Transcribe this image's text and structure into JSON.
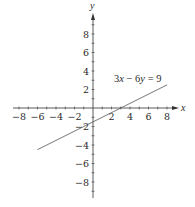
{
  "chart_data": {
    "type": "line",
    "title": "",
    "xlabel": "x",
    "ylabel": "y",
    "xlim": [
      -9,
      9
    ],
    "ylim": [
      -9.5,
      9.5
    ],
    "grid": false,
    "x_ticks": [
      -8,
      -6,
      -4,
      -2,
      2,
      4,
      6,
      8
    ],
    "y_ticks": [
      -8,
      -6,
      -4,
      -2,
      2,
      4,
      6,
      8
    ],
    "x_tick_labels": [
      "−8",
      "−6",
      "−4",
      "−2",
      "2",
      "4",
      "6",
      "8"
    ],
    "y_tick_labels": [
      "−8",
      "−6",
      "−4",
      "−2",
      "2",
      "4",
      "6",
      "8"
    ],
    "series": [
      {
        "name": "3x − 6y = 9",
        "equation": "3x − 6y = 9",
        "x": [
          -6,
          8
        ],
        "y": [
          -4.5,
          2.5
        ],
        "color": "#555555"
      }
    ],
    "annotations": [
      {
        "text": "3x − 6y = 9",
        "x": 2.2,
        "y": 3
      }
    ]
  },
  "labels": {
    "x_axis": "x",
    "y_axis": "y",
    "equation": "3x − 6y = 9"
  }
}
